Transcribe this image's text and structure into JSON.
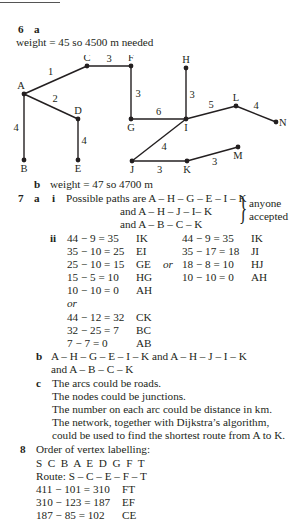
{
  "q6": {
    "number": "6",
    "part_a": "a",
    "a_text": "weight = 45 so 4500 m needed",
    "part_b": "b",
    "b_text": "weight = 47 so 4700 m"
  },
  "graph": {
    "nodes": [
      {
        "id": "A",
        "x": 24,
        "y": 39
      },
      {
        "id": "C",
        "x": 87,
        "y": 11
      },
      {
        "id": "F",
        "x": 131,
        "y": 11
      },
      {
        "id": "D",
        "x": 78,
        "y": 64
      },
      {
        "id": "B",
        "x": 24,
        "y": 105
      },
      {
        "id": "E",
        "x": 78,
        "y": 105
      },
      {
        "id": "G",
        "x": 131,
        "y": 64
      },
      {
        "id": "H",
        "x": 186,
        "y": 13
      },
      {
        "id": "I",
        "x": 186,
        "y": 64
      },
      {
        "id": "L",
        "x": 236,
        "y": 51
      },
      {
        "id": "N",
        "x": 276,
        "y": 67
      },
      {
        "id": "J",
        "x": 132,
        "y": 106
      },
      {
        "id": "K",
        "x": 187,
        "y": 106
      },
      {
        "id": "M",
        "x": 238,
        "y": 92
      }
    ],
    "edges": [
      {
        "from": "A",
        "to": "C",
        "weight": "1"
      },
      {
        "from": "C",
        "to": "F",
        "weight": "3"
      },
      {
        "from": "A",
        "to": "D",
        "weight": "2"
      },
      {
        "from": "A",
        "to": "B",
        "weight": "4"
      },
      {
        "from": "D",
        "to": "E",
        "weight": "4"
      },
      {
        "from": "F",
        "to": "G",
        "weight": "3"
      },
      {
        "from": "G",
        "to": "I",
        "weight": "6"
      },
      {
        "from": "H",
        "to": "I",
        "weight": "3"
      },
      {
        "from": "I",
        "to": "L",
        "weight": "5"
      },
      {
        "from": "L",
        "to": "N",
        "weight": "4"
      },
      {
        "from": "I",
        "to": "J",
        "weight": "4"
      },
      {
        "from": "J",
        "to": "K",
        "weight": "3"
      },
      {
        "from": "K",
        "to": "M",
        "weight": "3"
      }
    ]
  },
  "q7": {
    "number": "7",
    "part_a": "a",
    "sub_i": "i",
    "paths_line1": "Possible paths are A – H – G – E – I – K",
    "paths_line2": "and A – H – J – I– K",
    "paths_line3": "and A – B – C – K",
    "brace_note_1": "anyone",
    "brace_note_2": "accepted",
    "sub_ii": "ii",
    "or_label": "or",
    "col1": [
      {
        "calc": "44 − 9 = 35",
        "arc": "IK"
      },
      {
        "calc": "35 − 10 = 25",
        "arc": "EI"
      },
      {
        "calc": "25 − 10 = 15",
        "arc": "GE"
      },
      {
        "calc": "15 − 5 = 10",
        "arc": "HG"
      },
      {
        "calc": "10 − 10 = 0",
        "arc": "AH"
      }
    ],
    "col2": [
      {
        "calc": "44 − 9 = 35",
        "arc": "IK"
      },
      {
        "calc": "35 − 17 = 18",
        "arc": "JI"
      },
      {
        "calc": "18 − 8 = 10",
        "arc": "HJ"
      },
      {
        "calc": "10 − 10 = 0",
        "arc": "AH"
      }
    ],
    "col3": [
      {
        "calc": "44 − 12 = 32",
        "arc": "CK"
      },
      {
        "calc": "32 − 25 = 7",
        "arc": "BC"
      },
      {
        "calc": "7 − 7 = 0",
        "arc": "AB"
      }
    ],
    "part_b": "b",
    "b_line1": "A – H – G – E – I – K and A – H – J – I – K",
    "b_line2": "and A – B – C – K",
    "part_c": "c",
    "c_lines": [
      "The arcs could be roads.",
      "The nodes could be junctions.",
      "The number on each arc could be distance in km.",
      "The network, together with Dijkstra’s algorithm,",
      "could be used to find the shortest route from A to K."
    ]
  },
  "q8": {
    "number": "8",
    "heading": "Order of vertex labelling:",
    "order": "S  C  B  A  E  D  G  F  T",
    "route": "Route: S – C – E – F – T",
    "calcs": [
      {
        "calc": "411 − 101 = 310",
        "arc": "FT"
      },
      {
        "calc": "310 − 123 = 187",
        "arc": "EF"
      },
      {
        "calc": "187 − 85 = 102",
        "arc": "CE"
      }
    ]
  }
}
